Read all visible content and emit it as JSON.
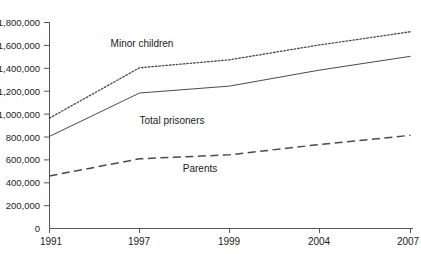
{
  "chart_data": {
    "type": "line",
    "title": "",
    "xlabel": "",
    "ylabel": "",
    "categories": [
      "1991",
      "1997",
      "1999",
      "2004",
      "2007"
    ],
    "ylim": [
      0,
      1800000
    ],
    "ytick_labels": [
      "1,800,000",
      "1,600,000",
      "1,400,000",
      "1,200,000",
      "1,000,000",
      "800,000",
      "600,000",
      "400,000",
      "200,000",
      "0"
    ],
    "ytick_values": [
      1800000,
      1600000,
      1400000,
      1200000,
      1000000,
      800000,
      600000,
      400000,
      200000,
      0
    ],
    "grid": false,
    "legend_position": "inline-annotations",
    "series": [
      {
        "name": "Minor children",
        "style": "dotted",
        "values": [
          960000,
          1400000,
          1470000,
          1600000,
          1715000
        ],
        "annotation": "Minor children"
      },
      {
        "name": "Total prisoners",
        "style": "solid",
        "values": [
          800000,
          1180000,
          1240000,
          1380000,
          1500000
        ],
        "annotation": "Total prisoners"
      },
      {
        "name": "Parents",
        "style": "dashed",
        "values": [
          455000,
          605000,
          640000,
          730000,
          810000
        ],
        "annotation": "Parents"
      }
    ],
    "annotations": [
      {
        "text": "Minor children",
        "x_px": 142,
        "y_px": 47
      },
      {
        "text": "Total prisoners",
        "x_px": 172,
        "y_px": 124
      },
      {
        "text": "Parents",
        "x_px": 200,
        "y_px": 172
      }
    ]
  }
}
